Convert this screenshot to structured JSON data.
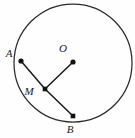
{
  "figure": {
    "type": "geometry-diagram",
    "background_color": "#fefefe",
    "stroke_color": "#1a1a1a",
    "circle_stroke_color": "#2b2b2b",
    "canvas": {
      "width": 135,
      "height": 138
    },
    "circle": {
      "cx": 73,
      "cy": 63,
      "r": 59
    },
    "points": [
      {
        "id": "A",
        "label": "A",
        "x": 21,
        "y": 61,
        "label_x": 9,
        "label_y": 57,
        "on_circle": true
      },
      {
        "id": "O",
        "label": "O",
        "x": 73,
        "y": 62,
        "label_x": 63,
        "label_y": 52,
        "on_circle": false
      },
      {
        "id": "M",
        "label": "M",
        "x": 45,
        "y": 89,
        "label_x": 29,
        "label_y": 95,
        "on_circle": false
      },
      {
        "id": "B",
        "label": "B",
        "x": 73,
        "y": 116,
        "label_x": 70,
        "label_y": 133,
        "on_circle": true
      }
    ],
    "segments": [
      {
        "id": "AM",
        "from": "A",
        "to": "M",
        "x1": 21,
        "y1": 61,
        "x2": 45,
        "y2": 89
      },
      {
        "id": "MB",
        "from": "M",
        "to": "B",
        "x1": 45,
        "y1": 89,
        "x2": 73,
        "y2": 116
      },
      {
        "id": "OM",
        "from": "O",
        "to": "M",
        "x1": 73,
        "y1": 62,
        "x2": 45,
        "y2": 89
      }
    ]
  }
}
